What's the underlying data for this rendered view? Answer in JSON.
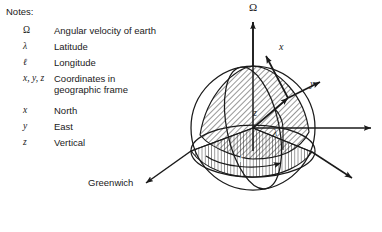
{
  "notes": {
    "heading": "Notes:",
    "entries": [
      {
        "symbol": "Ω",
        "symbol_style": "upright",
        "description": "Angular velocity of earth"
      },
      {
        "symbol": "λ",
        "symbol_style": "italic",
        "description": "Latitude"
      },
      {
        "symbol": "ℓ",
        "symbol_style": "italic",
        "description": "Longitude"
      },
      {
        "symbol": "x, y, z",
        "symbol_style": "italic",
        "description": "Coordinates in\n geographic frame"
      },
      {
        "symbol": "x",
        "symbol_style": "italic",
        "description": "North"
      },
      {
        "symbol": "y",
        "symbol_style": "italic",
        "description": "East"
      },
      {
        "symbol": "z",
        "symbol_style": "italic",
        "description": "Vertical"
      }
    ]
  },
  "diagram": {
    "labels": {
      "omega": "Ω",
      "x_axis": "x",
      "y_axis": "y",
      "z_axis": "z",
      "latitude": "λ",
      "longitude": "ℓ",
      "greenwich": "Greenwich"
    },
    "colors": {
      "stroke": "#1a1a1a",
      "hatch": "#1a1a1a",
      "background": "#ffffff",
      "longitude_label": "#ffffff"
    },
    "geometry": {
      "center_x": 253,
      "center_y": 128,
      "radius": 62,
      "pole_y": 48
    }
  }
}
